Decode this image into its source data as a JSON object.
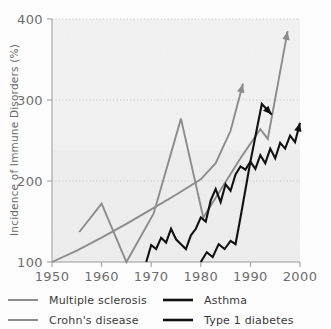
{
  "chart_data": {
    "type": "line",
    "title": "",
    "subtitle": "",
    "xlabel": "",
    "ylabel": "Incidence of Immune Disorders (%)",
    "xlim": [
      1950,
      2000
    ],
    "ylim": [
      100,
      400
    ],
    "xticks": [
      "1950",
      "1960",
      "1970",
      "1980",
      "1990",
      "2000"
    ],
    "yticks": [
      "100",
      "200",
      "300",
      "400"
    ],
    "grid": "horizontal-dotted",
    "legend_position": "bottom",
    "colors": {
      "multiple_sclerosis": "#8c8c8c",
      "crohns_disease": "#8c8c8c",
      "asthma": "#111111",
      "type1_diabetes": "#111111",
      "grid": "#c9c9c9",
      "axis": "#9a9a9a",
      "background": "#f2f2f2",
      "tick_label": "#6e6e6e",
      "legend_label": "#3a3a3a"
    },
    "annotations": [
      "All four series terminate in an upward arrowhead",
      "Type 1 diabetes arrow points right and slightly downward near 1993"
    ],
    "series": [
      {
        "name": "Multiple sclerosis",
        "color": "#8c8c8c",
        "arrow": true,
        "points": [
          [
            1950,
            100
          ],
          [
            1955,
            114
          ],
          [
            1960,
            130
          ],
          [
            1965,
            147
          ],
          [
            1970,
            165
          ],
          [
            1975,
            183
          ],
          [
            1980,
            202
          ],
          [
            1983,
            222
          ],
          [
            1986,
            262
          ],
          [
            1988.5,
            320
          ]
        ]
      },
      {
        "name": "Crohn's disease",
        "color": "#8c8c8c",
        "arrow": true,
        "points": [
          [
            1955.5,
            137
          ],
          [
            1960,
            172
          ],
          [
            1965,
            100
          ],
          [
            1970.5,
            160
          ],
          [
            1976,
            277
          ],
          [
            1980.5,
            155
          ],
          [
            1988,
            228
          ],
          [
            1992,
            264
          ],
          [
            1993.5,
            252
          ],
          [
            1997.5,
            385
          ]
        ]
      },
      {
        "name": "Asthma",
        "color": "#111111",
        "arrow": true,
        "points": [
          [
            1969,
            100
          ],
          [
            1970,
            121
          ],
          [
            1971,
            116
          ],
          [
            1972,
            130
          ],
          [
            1973,
            124
          ],
          [
            1974,
            141
          ],
          [
            1975,
            128
          ],
          [
            1976,
            122
          ],
          [
            1977,
            116
          ],
          [
            1978,
            133
          ],
          [
            1979,
            141
          ],
          [
            1980,
            155
          ],
          [
            1981,
            150
          ],
          [
            1982,
            176
          ],
          [
            1983,
            190
          ],
          [
            1984,
            174
          ],
          [
            1985,
            196
          ],
          [
            1986,
            188
          ],
          [
            1987,
            208
          ],
          [
            1988,
            218
          ],
          [
            1989,
            214
          ],
          [
            1990,
            224
          ],
          [
            1991,
            215
          ],
          [
            1992,
            232
          ],
          [
            1993,
            222
          ],
          [
            1994,
            240
          ],
          [
            1995,
            228
          ],
          [
            1996,
            247
          ],
          [
            1997,
            240
          ],
          [
            1998,
            256
          ],
          [
            1999,
            248
          ],
          [
            2000,
            272
          ]
        ]
      },
      {
        "name": "Type 1 diabetes",
        "color": "#111111",
        "arrow": true,
        "points": [
          [
            1980,
            100
          ],
          [
            1981.2,
            112
          ],
          [
            1982.4,
            106
          ],
          [
            1983.6,
            122
          ],
          [
            1984.8,
            116
          ],
          [
            1986,
            126
          ],
          [
            1987,
            122
          ],
          [
            1988,
            155
          ],
          [
            1990,
            224
          ],
          [
            1992.3,
            295
          ],
          [
            1994.3,
            282
          ]
        ]
      }
    ]
  },
  "legend": {
    "items": [
      {
        "label": "Multiple sclerosis",
        "color": "#8c8c8c"
      },
      {
        "label": "Asthma",
        "color": "#111111"
      },
      {
        "label": "Crohn's disease",
        "color": "#8c8c8c"
      },
      {
        "label": "Type 1 diabetes",
        "color": "#111111"
      }
    ]
  }
}
